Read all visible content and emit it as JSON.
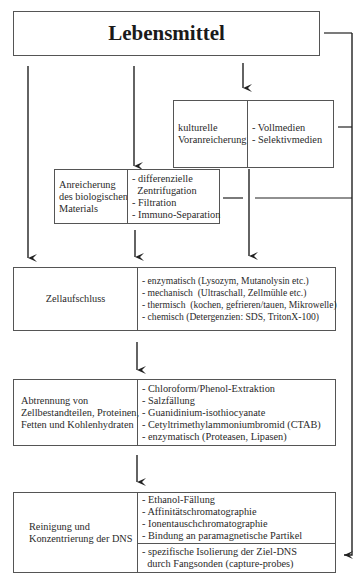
{
  "title": "Lebensmittel",
  "kulturell": {
    "label_lines": [
      "kulturelle",
      "Voranreicherung"
    ],
    "items": [
      "- Vollmedien",
      "- Selektivmedien"
    ]
  },
  "anreicherung": {
    "label_lines": [
      "Anreicherung",
      "des biologischen",
      "Materials"
    ],
    "items": [
      "- differenzielle",
      "  Zentrifugation",
      "- Filtration",
      "- Immuno-Separation"
    ]
  },
  "zellaufschluss": {
    "label": "Zellaufschluss",
    "items": [
      "- enzymatisch (Lysozym, Mutanolysin etc.)",
      "- mechanisch  (Ultraschall, Zellmühle etc.)",
      "- thermisch  (kochen, gefrieren/tauen, Mikrowelle)",
      "- chemisch (Detergenzien: SDS, TritonX-100)"
    ]
  },
  "abtrennung": {
    "label_lines": [
      "Abtrennung von",
      "Zellbestandteilen, Proteinen,",
      "Fetten und Kohlenhydraten"
    ],
    "items": [
      "- Chloroform/Phenol-Extraktion",
      "- Salzfällung",
      "- Guanidinium-isothiocyanate",
      "- Cetyltrimethylammoniumbromid (CTAB)",
      "- enzymatisch (Proteasen, Lipasen)"
    ]
  },
  "reinigung": {
    "label_lines": [
      "Reinigung und",
      "Konzentrierung der DNS"
    ],
    "items_top": [
      "- Ethanol-Fällung",
      "- Affinitätschromatographie",
      "- Ionentauschchromatographie",
      "- Bindung an paramagnetische Partikel"
    ],
    "items_bottom": [
      "- spezifische Isolierung der Ziel-DNS",
      "  durch Fangsonden (capture-probes)"
    ]
  }
}
